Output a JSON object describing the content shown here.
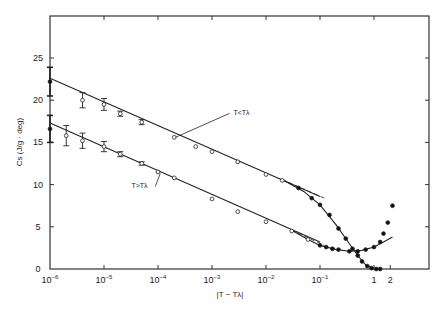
{
  "chart_data": {
    "type": "scatter",
    "title": "",
    "xlabel": "|T − Tλ|",
    "ylabel": "Cs (J/g · deg)",
    "x_scale": "log",
    "xlim": [
      1e-06,
      3.5
    ],
    "ylim": [
      0,
      30
    ],
    "x_ticks": [
      {
        "value": 1e-06,
        "base": "10",
        "exp": "−6"
      },
      {
        "value": 1e-05,
        "base": "10",
        "exp": "−5"
      },
      {
        "value": 0.0001,
        "base": "10",
        "exp": "−4"
      },
      {
        "value": 0.001,
        "base": "10",
        "exp": "−3"
      },
      {
        "value": 0.01,
        "base": "10",
        "exp": "−2"
      },
      {
        "value": 0.1,
        "base": "10",
        "exp": "−1"
      },
      {
        "value": 1,
        "base": "1",
        "exp": ""
      },
      {
        "value": 2,
        "base": "2",
        "exp": ""
      }
    ],
    "y_ticks": [
      0,
      5,
      10,
      15,
      20,
      25
    ],
    "grid": false,
    "annotations": [
      {
        "text": "T<Tλ",
        "x": 0.0025,
        "y": 18.2
      },
      {
        "text": "T>Tλ",
        "x": 3.5e-06,
        "y": 9.8
      }
    ],
    "series": [
      {
        "name": "T<Tλ",
        "fit_line": {
          "x": [
            1e-06,
            0.1
          ],
          "y": [
            22.6,
            8.6
          ]
        },
        "dashed_extension": {
          "x": [
            0.02,
            0.12
          ],
          "y": [
            10.6,
            8.4
          ]
        },
        "curve": {
          "x": [
            0.02,
            0.05,
            0.1,
            0.2,
            0.35,
            0.5,
            0.7,
            1.0,
            1.3
          ],
          "y": [
            10.6,
            9.2,
            7.6,
            5.2,
            3.0,
            1.6,
            0.5,
            0.05,
            0.0
          ]
        },
        "points": [
          {
            "x": 1e-06,
            "y": 22.2,
            "err": 1.7,
            "marker": "filled"
          },
          {
            "x": 4e-06,
            "y": 20.0,
            "err": 0.9,
            "marker": "open"
          },
          {
            "x": 1e-05,
            "y": 19.5,
            "err": 0.7,
            "marker": "open"
          },
          {
            "x": 2e-05,
            "y": 18.4,
            "err": 0.3,
            "marker": "open"
          },
          {
            "x": 5e-05,
            "y": 17.4,
            "err": 0.3,
            "marker": "open"
          },
          {
            "x": 0.0002,
            "y": 15.6,
            "err": 0,
            "marker": "open"
          },
          {
            "x": 0.0005,
            "y": 14.5,
            "err": 0,
            "marker": "open"
          },
          {
            "x": 0.001,
            "y": 13.9,
            "err": 0,
            "marker": "open"
          },
          {
            "x": 0.003,
            "y": 12.7,
            "err": 0,
            "marker": "open"
          },
          {
            "x": 0.01,
            "y": 11.2,
            "err": 0,
            "marker": "open"
          },
          {
            "x": 0.02,
            "y": 10.5,
            "err": 0,
            "marker": "open"
          },
          {
            "x": 0.04,
            "y": 9.6,
            "err": 0,
            "marker": "filled"
          },
          {
            "x": 0.07,
            "y": 8.4,
            "err": 0,
            "marker": "filled"
          },
          {
            "x": 0.1,
            "y": 7.6,
            "err": 0,
            "marker": "filled"
          },
          {
            "x": 0.15,
            "y": 6.4,
            "err": 0,
            "marker": "filled"
          },
          {
            "x": 0.22,
            "y": 4.8,
            "err": 0,
            "marker": "filled"
          },
          {
            "x": 0.3,
            "y": 3.6,
            "err": 0,
            "marker": "filled"
          },
          {
            "x": 0.4,
            "y": 2.4,
            "err": 0,
            "marker": "filled"
          },
          {
            "x": 0.5,
            "y": 1.6,
            "err": 0,
            "marker": "filled"
          },
          {
            "x": 0.6,
            "y": 0.9,
            "err": 0,
            "marker": "filled"
          },
          {
            "x": 0.75,
            "y": 0.35,
            "err": 0,
            "marker": "filled"
          },
          {
            "x": 0.9,
            "y": 0.1,
            "err": 0,
            "marker": "filled"
          },
          {
            "x": 1.1,
            "y": 0.0,
            "err": 0,
            "marker": "filled"
          },
          {
            "x": 1.3,
            "y": 0.0,
            "err": 0,
            "marker": "filled"
          }
        ]
      },
      {
        "name": "T>Tλ",
        "fit_line": {
          "x": [
            1e-06,
            0.1
          ],
          "y": [
            17.3,
            3.2
          ]
        },
        "dashed_extension": {
          "x": [
            0.03,
            0.12
          ],
          "y": [
            4.6,
            2.8
          ]
        },
        "curve": {
          "x": [
            0.03,
            0.06,
            0.1,
            0.2,
            0.35,
            0.6,
            1.0,
            1.5,
            2.2
          ],
          "y": [
            4.6,
            3.5,
            2.8,
            2.3,
            2.1,
            2.2,
            2.6,
            3.2,
            3.8
          ]
        },
        "points": [
          {
            "x": 1e-06,
            "y": 16.6,
            "err": 1.6,
            "marker": "filled"
          },
          {
            "x": 2e-06,
            "y": 15.8,
            "err": 1.2,
            "marker": "open"
          },
          {
            "x": 4e-06,
            "y": 15.2,
            "err": 0.9,
            "marker": "open"
          },
          {
            "x": 1e-05,
            "y": 14.5,
            "err": 0.6,
            "marker": "open"
          },
          {
            "x": 2e-05,
            "y": 13.6,
            "err": 0.3,
            "marker": "open"
          },
          {
            "x": 5e-05,
            "y": 12.5,
            "err": 0.2,
            "marker": "open"
          },
          {
            "x": 0.0001,
            "y": 11.5,
            "err": 0,
            "marker": "open"
          },
          {
            "x": 0.0002,
            "y": 10.8,
            "err": 0,
            "marker": "open"
          },
          {
            "x": 0.001,
            "y": 8.3,
            "err": 0,
            "marker": "open"
          },
          {
            "x": 0.003,
            "y": 6.8,
            "err": 0,
            "marker": "open"
          },
          {
            "x": 0.01,
            "y": 5.6,
            "err": 0,
            "marker": "open"
          },
          {
            "x": 0.03,
            "y": 4.5,
            "err": 0,
            "marker": "open"
          },
          {
            "x": 0.06,
            "y": 3.5,
            "err": 0,
            "marker": "open"
          },
          {
            "x": 0.1,
            "y": 2.8,
            "err": 0,
            "marker": "filled"
          },
          {
            "x": 0.13,
            "y": 2.6,
            "err": 0,
            "marker": "filled"
          },
          {
            "x": 0.17,
            "y": 2.4,
            "err": 0,
            "marker": "filled"
          },
          {
            "x": 0.22,
            "y": 2.3,
            "err": 0,
            "marker": "filled"
          },
          {
            "x": 0.35,
            "y": 2.1,
            "err": 0,
            "marker": "filled"
          },
          {
            "x": 0.5,
            "y": 2.1,
            "err": 0,
            "marker": "filled"
          },
          {
            "x": 0.7,
            "y": 2.3,
            "err": 0,
            "marker": "filled"
          },
          {
            "x": 1.0,
            "y": 2.6,
            "err": 0,
            "marker": "filled"
          },
          {
            "x": 1.3,
            "y": 3.2,
            "err": 0,
            "marker": "filled"
          },
          {
            "x": 1.5,
            "y": 4.2,
            "err": 0,
            "marker": "filled"
          },
          {
            "x": 1.8,
            "y": 5.5,
            "err": 0,
            "marker": "filled"
          },
          {
            "x": 2.2,
            "y": 7.5,
            "err": 0,
            "marker": "filled"
          }
        ]
      }
    ]
  }
}
